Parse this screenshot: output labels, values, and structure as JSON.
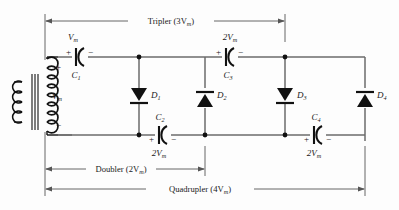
{
  "diagram": {
    "colors": {
      "wire": "#6b6b6b",
      "component": "#111111",
      "dimension": "#555555",
      "background": "#fdfdfd"
    },
    "source": {
      "name": "transformer",
      "secondary_label": "V",
      "secondary_sub": "m",
      "plus_sign": "+",
      "minus_sign": "−"
    },
    "capacitors": [
      {
        "id": "C1",
        "ref": "C",
        "ref_sub": "1",
        "value": "V",
        "value_sub": "m",
        "plus": "+",
        "minus": "−",
        "value_position": "above",
        "ref_position": "below"
      },
      {
        "id": "C2",
        "ref": "C",
        "ref_sub": "2",
        "value": "2V",
        "value_sub": "m",
        "plus": "+",
        "minus": "−",
        "value_position": "below",
        "ref_position": "above"
      },
      {
        "id": "C3",
        "ref": "C",
        "ref_sub": "3",
        "value": "2V",
        "value_sub": "m",
        "plus": "+",
        "minus": "−",
        "value_position": "above",
        "ref_position": "below"
      },
      {
        "id": "C4",
        "ref": "C",
        "ref_sub": "4",
        "value": "2V",
        "value_sub": "m",
        "plus": "+",
        "minus": "−",
        "value_position": "below",
        "ref_position": "above"
      }
    ],
    "diodes": [
      {
        "id": "D1",
        "ref": "D",
        "ref_sub": "1",
        "direction": "down"
      },
      {
        "id": "D2",
        "ref": "D",
        "ref_sub": "2",
        "direction": "up"
      },
      {
        "id": "D3",
        "ref": "D",
        "ref_sub": "3",
        "direction": "down"
      },
      {
        "id": "D4",
        "ref": "D",
        "ref_sub": "4",
        "direction": "up"
      }
    ],
    "dimensions": [
      {
        "id": "tripler",
        "label": "Tripler (3V",
        "label_sub": "m",
        "label_tail": ")",
        "position": "top"
      },
      {
        "id": "doubler",
        "label": "Doubler (2V",
        "label_sub": "m",
        "label_tail": ")",
        "position": "bottom"
      },
      {
        "id": "quadrupler",
        "label": "Quadrupler (4V",
        "label_sub": "m",
        "label_tail": ")",
        "position": "bottom"
      }
    ]
  }
}
